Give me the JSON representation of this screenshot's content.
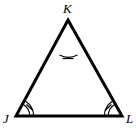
{
  "figure": {
    "type": "geometry-diagram",
    "shape": "triangle",
    "name": "Triangle JKL",
    "background_color": "#ffffff",
    "stroke_color": "#000000",
    "stroke_width": 3,
    "mark_stroke_width": 1.1,
    "vertices": [
      {
        "id": "K",
        "label": "K",
        "x": 68,
        "y": 20,
        "label_x": 63,
        "label_y": 13,
        "angle_marks": {
          "arcs": 1,
          "ticks": 1
        }
      },
      {
        "id": "J",
        "label": "J",
        "x": 16,
        "y": 116,
        "label_x": 3,
        "label_y": 123,
        "angle_marks": {
          "arcs": 2,
          "ticks": 1
        }
      },
      {
        "id": "L",
        "label": "L",
        "x": 122,
        "y": 116,
        "label_x": 126,
        "label_y": 123,
        "angle_marks": {
          "arcs": 2,
          "ticks": 1
        }
      }
    ],
    "sides": [
      {
        "id": "JK",
        "from": "J",
        "to": "K"
      },
      {
        "id": "KL",
        "from": "K",
        "to": "L"
      },
      {
        "id": "JL",
        "from": "J",
        "to": "L"
      }
    ],
    "angle_mark_note": "congruent angle marks at all three vertices"
  }
}
